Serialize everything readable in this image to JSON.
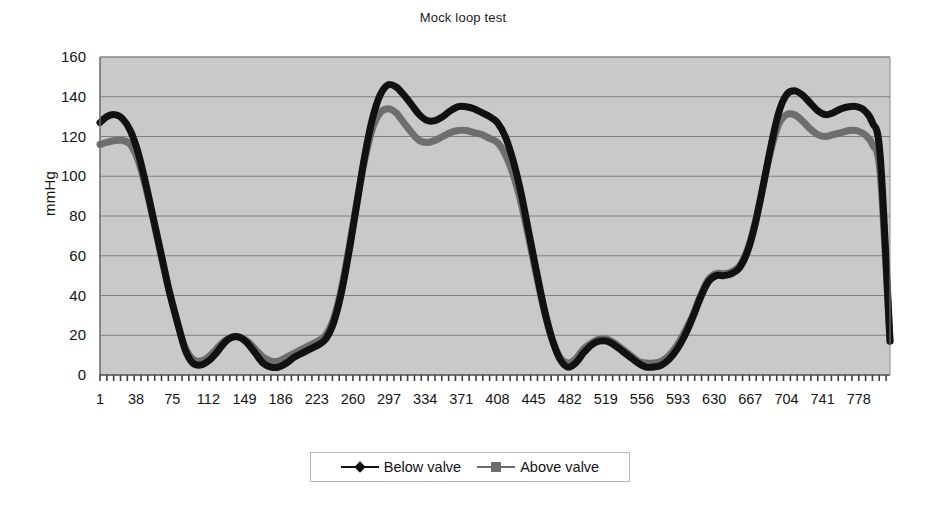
{
  "chart_data": {
    "type": "line",
    "title": "Mock loop test",
    "xlabel": "",
    "ylabel": "mmHg",
    "ylim": [
      0,
      160
    ],
    "ytick_step": 20,
    "yticks": [
      0,
      20,
      40,
      60,
      80,
      100,
      120,
      140,
      160
    ],
    "xticks": [
      1,
      38,
      75,
      112,
      149,
      186,
      223,
      260,
      297,
      334,
      371,
      408,
      445,
      482,
      519,
      556,
      593,
      630,
      667,
      704,
      741,
      778
    ],
    "xlim": [
      1,
      810
    ],
    "grid": "horizontal",
    "legend_position": "bottom",
    "plot_background": "#c9c9c9",
    "gridline_color": "#808080",
    "series": [
      {
        "name": "Below valve",
        "color": "#111111",
        "marker": "diamond",
        "x": [
          1,
          8,
          16,
          24,
          32,
          40,
          48,
          56,
          64,
          72,
          80,
          88,
          96,
          104,
          112,
          120,
          128,
          136,
          144,
          152,
          160,
          168,
          176,
          184,
          192,
          200,
          208,
          216,
          224,
          232,
          240,
          248,
          256,
          264,
          272,
          280,
          288,
          296,
          304,
          312,
          320,
          328,
          336,
          344,
          352,
          360,
          368,
          376,
          384,
          392,
          400,
          408,
          416,
          424,
          432,
          440,
          448,
          456,
          464,
          472,
          480,
          488,
          496,
          504,
          512,
          520,
          528,
          536,
          544,
          552,
          560,
          568,
          576,
          584,
          592,
          600,
          608,
          616,
          624,
          632,
          640,
          648,
          656,
          664,
          672,
          680,
          688,
          696,
          704,
          712,
          720,
          728,
          736,
          744,
          752,
          760,
          768,
          776,
          784,
          792,
          800,
          810
        ],
        "y": [
          127,
          130,
          131,
          129,
          123,
          112,
          96,
          78,
          60,
          42,
          27,
          13,
          6,
          5,
          7,
          11,
          16,
          19,
          19,
          16,
          11,
          6,
          4,
          4,
          6,
          9,
          11,
          13,
          15,
          18,
          26,
          41,
          62,
          86,
          110,
          129,
          141,
          146,
          145,
          141,
          136,
          131,
          128,
          128,
          130,
          133,
          135,
          135,
          134,
          132,
          130,
          127,
          120,
          108,
          92,
          72,
          52,
          33,
          18,
          8,
          4,
          6,
          11,
          15,
          17,
          17,
          15,
          12,
          9,
          6,
          4,
          4,
          5,
          8,
          13,
          20,
          29,
          39,
          47,
          50,
          50,
          51,
          54,
          62,
          76,
          95,
          115,
          132,
          141,
          143,
          141,
          137,
          133,
          131,
          132,
          134,
          135,
          135,
          133,
          127,
          110,
          17
        ]
      },
      {
        "name": "Above valve",
        "color": "#6e6e6e",
        "marker": "square",
        "x": [
          1,
          8,
          16,
          24,
          32,
          40,
          48,
          56,
          64,
          72,
          80,
          88,
          96,
          104,
          112,
          120,
          128,
          136,
          144,
          152,
          160,
          168,
          176,
          184,
          192,
          200,
          208,
          216,
          224,
          232,
          240,
          248,
          256,
          264,
          272,
          280,
          288,
          296,
          304,
          312,
          320,
          328,
          336,
          344,
          352,
          360,
          368,
          376,
          384,
          392,
          400,
          408,
          416,
          424,
          432,
          440,
          448,
          456,
          464,
          472,
          480,
          488,
          496,
          504,
          512,
          520,
          528,
          536,
          544,
          552,
          560,
          568,
          576,
          584,
          592,
          600,
          608,
          616,
          624,
          632,
          640,
          648,
          656,
          664,
          672,
          680,
          688,
          696,
          704,
          712,
          720,
          728,
          736,
          744,
          752,
          760,
          768,
          776,
          784,
          792,
          800,
          810
        ],
        "y": [
          116,
          117,
          118,
          118,
          116,
          108,
          94,
          77,
          59,
          42,
          27,
          14,
          8,
          7,
          9,
          13,
          17,
          19,
          19,
          17,
          13,
          9,
          7,
          7,
          9,
          11,
          13,
          15,
          17,
          20,
          28,
          43,
          64,
          87,
          108,
          124,
          132,
          134,
          132,
          127,
          122,
          118,
          117,
          118,
          120,
          122,
          123,
          123,
          122,
          121,
          119,
          117,
          111,
          101,
          87,
          69,
          50,
          32,
          18,
          9,
          6,
          8,
          13,
          16,
          18,
          18,
          16,
          13,
          10,
          7,
          6,
          6,
          7,
          10,
          15,
          22,
          30,
          40,
          48,
          51,
          51,
          52,
          55,
          63,
          77,
          95,
          113,
          126,
          131,
          131,
          128,
          124,
          121,
          120,
          121,
          122,
          123,
          123,
          121,
          116,
          101,
          17
        ]
      }
    ]
  },
  "chart": {
    "title": "Mock loop test",
    "y_axis_title": "mmHg",
    "y_tick_labels": [
      "160",
      "140",
      "120",
      "100",
      "80",
      "60",
      "40",
      "20",
      "0"
    ],
    "x_tick_labels": [
      "1",
      "38",
      "75",
      "112",
      "149",
      "186",
      "223",
      "260",
      "297",
      "334",
      "371",
      "408",
      "445",
      "482",
      "519",
      "556",
      "593",
      "630",
      "667",
      "704",
      "741",
      "778"
    ]
  },
  "legend": {
    "items": [
      {
        "label": "Below valve",
        "color": "#111111",
        "marker": "diamond-marker-icon"
      },
      {
        "label": "Above valve",
        "color": "#6e6e6e",
        "marker": "square-marker-icon"
      }
    ]
  }
}
